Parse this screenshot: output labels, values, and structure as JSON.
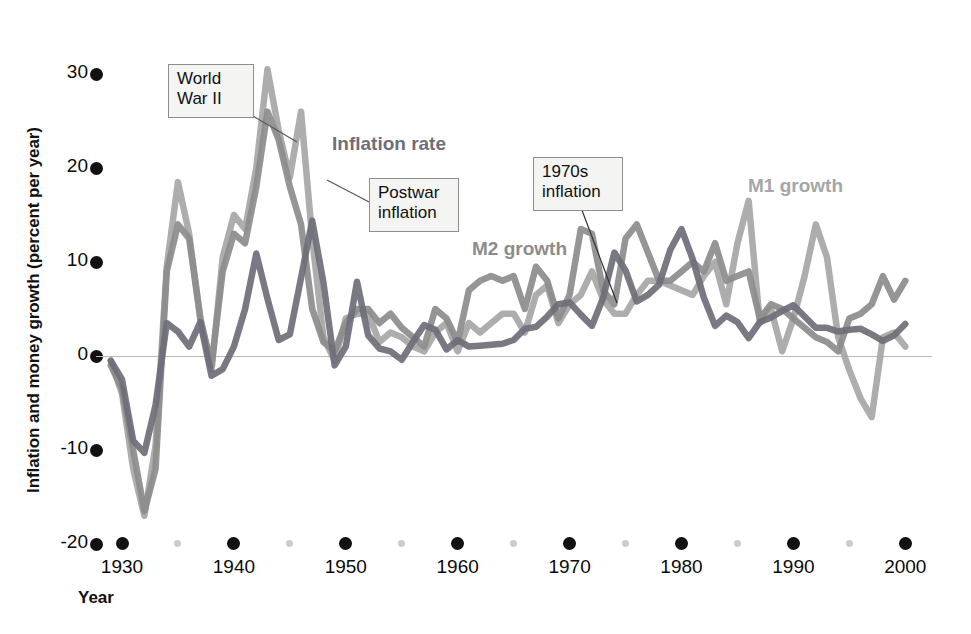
{
  "axes": {
    "ylabel": "Inflation and money growth (percent per year)",
    "xlabel": "Year",
    "yticks": [
      "30",
      "20",
      "10",
      "0",
      "-10",
      "-20"
    ],
    "xticks": [
      "1930",
      "1940",
      "1950",
      "1960",
      "1970",
      "1980",
      "1990",
      "2000"
    ]
  },
  "annotations": {
    "ww2": "World\nWar II",
    "postwar": "Postwar\ninflation",
    "seventies": "1970s\ninflation"
  },
  "series_labels": {
    "inflation": "Inflation rate",
    "m2": "M2 growth",
    "m1": "M1 growth"
  },
  "colors": {
    "inflation": "#6e6e78",
    "m2": "#8c8c8c",
    "m1": "#a6a6a6",
    "zero_line": "#b9b9b9",
    "tick": "#111111",
    "minor_tick": "#cccccc",
    "annot_fill": "#f4f4f2",
    "annot_border": "#8e8e8e"
  },
  "chart_data": {
    "type": "line",
    "title": "",
    "xlabel": "Year",
    "ylabel": "Inflation and money growth (percent per year)",
    "xlim": [
      1929,
      2000
    ],
    "ylim": [
      -20,
      30
    ],
    "grid": false,
    "legend": "inline-labels",
    "x": [
      1929,
      1930,
      1931,
      1932,
      1933,
      1934,
      1935,
      1936,
      1937,
      1938,
      1939,
      1940,
      1941,
      1942,
      1943,
      1944,
      1945,
      1946,
      1947,
      1948,
      1949,
      1950,
      1951,
      1952,
      1953,
      1954,
      1955,
      1956,
      1957,
      1958,
      1959,
      1960,
      1961,
      1962,
      1963,
      1964,
      1965,
      1966,
      1967,
      1968,
      1969,
      1970,
      1971,
      1972,
      1973,
      1974,
      1975,
      1976,
      1977,
      1978,
      1979,
      1980,
      1981,
      1982,
      1983,
      1984,
      1985,
      1986,
      1987,
      1988,
      1989,
      1990,
      1991,
      1992,
      1993,
      1994,
      1995,
      1996,
      1997,
      1998,
      1999,
      2000
    ],
    "series": [
      {
        "name": "Inflation rate",
        "color": "#6e6e78",
        "values": [
          -0.5,
          -2.5,
          -9.0,
          -10.3,
          -5.2,
          3.5,
          2.6,
          1.0,
          3.6,
          -2.1,
          -1.4,
          1.0,
          5.0,
          10.9,
          6.1,
          1.7,
          2.3,
          8.3,
          14.4,
          7.8,
          -1.0,
          1.0,
          7.9,
          2.2,
          0.8,
          0.5,
          -0.4,
          1.5,
          3.3,
          2.8,
          0.7,
          1.7,
          1.0,
          1.1,
          1.2,
          1.3,
          1.7,
          2.9,
          3.1,
          4.2,
          5.5,
          5.7,
          4.4,
          3.2,
          6.2,
          11.0,
          9.1,
          5.8,
          6.5,
          7.6,
          11.3,
          13.5,
          10.3,
          6.2,
          3.2,
          4.3,
          3.6,
          1.9,
          3.6,
          4.1,
          4.8,
          5.4,
          4.2,
          3.0,
          3.0,
          2.6,
          2.8,
          2.9,
          2.3,
          1.6,
          2.2,
          3.4
        ]
      },
      {
        "name": "M2 growth",
        "color": "#8c8c8c",
        "values": [
          -1.0,
          -3.5,
          -10.0,
          -16.5,
          -12.0,
          9.0,
          14.0,
          12.5,
          4.0,
          -1.0,
          9.0,
          13.0,
          12.0,
          18.0,
          26.0,
          23.0,
          18.0,
          14.0,
          5.0,
          1.5,
          0.5,
          3.5,
          5.0,
          5.0,
          3.5,
          4.5,
          3.0,
          2.0,
          1.0,
          5.0,
          4.0,
          1.5,
          7.0,
          8.0,
          8.5,
          8.0,
          8.5,
          5.0,
          9.5,
          8.0,
          4.0,
          6.5,
          13.5,
          13.0,
          7.0,
          5.5,
          12.5,
          14.0,
          11.0,
          8.0,
          8.0,
          9.0,
          10.0,
          9.0,
          12.0,
          8.0,
          8.5,
          9.0,
          4.0,
          5.5,
          5.0,
          4.0,
          3.0,
          2.0,
          1.5,
          0.5,
          4.0,
          4.5,
          5.5,
          8.5,
          6.0,
          8.0
        ]
      },
      {
        "name": "M1 growth",
        "color": "#a6a6a6",
        "values": [
          -0.5,
          -4.0,
          -12.0,
          -17.0,
          -9.5,
          9.5,
          18.5,
          13.0,
          4.0,
          -1.5,
          10.5,
          15.0,
          13.5,
          20.0,
          30.5,
          24.0,
          19.0,
          26.0,
          12.5,
          2.0,
          -0.5,
          4.0,
          4.5,
          4.5,
          1.5,
          2.5,
          2.0,
          1.0,
          0.5,
          2.5,
          3.5,
          0.5,
          3.5,
          2.5,
          3.5,
          4.5,
          4.5,
          2.5,
          6.5,
          7.5,
          3.5,
          5.5,
          6.5,
          9.0,
          6.0,
          4.5,
          4.5,
          6.5,
          8.0,
          8.0,
          7.5,
          7.0,
          6.5,
          8.5,
          10.0,
          5.5,
          12.0,
          16.5,
          3.5,
          5.0,
          0.5,
          4.0,
          8.5,
          14.0,
          10.5,
          2.0,
          -1.5,
          -4.5,
          -6.5,
          2.0,
          2.5,
          1.0
        ]
      }
    ],
    "annotations": [
      {
        "text": "World War II",
        "points_to_x": 1943,
        "points_to_y": 24
      },
      {
        "text": "Postwar inflation",
        "points_to_x": 1947,
        "points_to_y": 14
      },
      {
        "text": "1970s inflation",
        "points_to_x": 1974,
        "points_to_y": 6
      }
    ]
  }
}
